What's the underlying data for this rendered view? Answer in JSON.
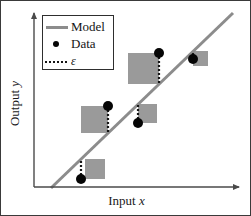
{
  "figure": {
    "kind": "scatter-with-regression-line",
    "background_color": "#ffffff",
    "border_color": "#3a3a3a"
  },
  "axes": {
    "x_label_prefix": "Input ",
    "x_label_symbol": "x",
    "y_label_prefix": "Output ",
    "y_label_symbol": "y",
    "axis_color": "#4a4a4a",
    "x_axis_y_px": 186,
    "y_axis_x_px": 33,
    "x_axis_end_px": 240,
    "y_axis_top_px": 10
  },
  "legend": {
    "border_color": "#2e2e2e",
    "items": [
      {
        "key": "line",
        "icon": "solid-line-icon",
        "label": "Model",
        "color": "#8c8c8c"
      },
      {
        "key": "point",
        "icon": "filled-dot-icon",
        "label": "Data",
        "color": "#050505"
      },
      {
        "key": "resid",
        "icon": "dotted-line-icon",
        "label": "ε",
        "color": "#151515"
      }
    ]
  },
  "chart_data": {
    "type": "scatter",
    "title": "",
    "xlabel": "Input x",
    "ylabel": "Output y",
    "grid": false,
    "legend_position": "top-left",
    "xlim": [
      33,
      240
    ],
    "ylim": [
      10,
      186
    ],
    "annotations": [
      "Gray squares depict the squared residual (error) area for each data point.",
      "Dotted vertical segments depict the residual ε between each data point and the model line."
    ],
    "series": [
      {
        "name": "Model",
        "type": "line",
        "color": "#8c8c8c",
        "linewidth": 3,
        "points_px": [
          [
            50,
            187
          ],
          [
            232,
            12
          ]
        ]
      },
      {
        "name": "Data",
        "type": "scatter",
        "color": "#050505",
        "marker": "filled-circle",
        "marker_radius_px": 5,
        "points_px": [
          [
            80,
            178
          ],
          [
            107,
            105
          ],
          [
            137,
            122
          ],
          [
            158,
            52
          ],
          [
            192,
            58
          ]
        ]
      },
      {
        "name": "ε",
        "type": "residual",
        "color": "#151515",
        "segments_px": [
          {
            "x": 80,
            "y_point": 178,
            "y_model": 158,
            "square": {
              "x": 84,
              "y": 158,
              "size": 20
            }
          },
          {
            "x": 107,
            "y_point": 105,
            "y_model": 132,
            "square": {
              "x": 80,
              "y": 105,
              "size": 27
            }
          },
          {
            "x": 137,
            "y_point": 122,
            "y_model": 103,
            "square": {
              "x": 137,
              "y": 103,
              "size": 19
            }
          },
          {
            "x": 158,
            "y_point": 52,
            "y_model": 83,
            "square": {
              "x": 127,
              "y": 52,
              "size": 31
            }
          },
          {
            "x": 192,
            "y_point": 58,
            "y_model": 50,
            "square": {
              "x": 192,
              "y": 50,
              "size": 15
            }
          }
        ],
        "square_fill": "#9a9a9a"
      }
    ]
  }
}
